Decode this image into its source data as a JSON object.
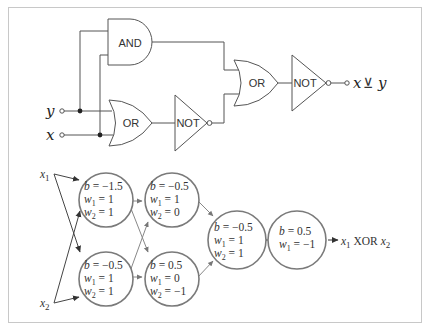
{
  "logic_circuit": {
    "inputs": [
      {
        "id": "y",
        "label": "y"
      },
      {
        "id": "x",
        "label": "x"
      }
    ],
    "gates": [
      {
        "id": "and1",
        "label": "AND"
      },
      {
        "id": "or1",
        "label": "OR"
      },
      {
        "id": "not1",
        "label": "NOT"
      },
      {
        "id": "or2",
        "label": "OR"
      },
      {
        "id": "not2",
        "label": "NOT"
      }
    ],
    "output": {
      "label_x": "x",
      "label_op": "⊻",
      "label_y": "y"
    }
  },
  "neural_network": {
    "inputs": [
      {
        "label": "x",
        "sub": "1"
      },
      {
        "label": "x",
        "sub": "2"
      }
    ],
    "neurons": [
      {
        "id": "n1",
        "lines": [
          [
            "b",
            "",
            " = −1.5"
          ],
          [
            "w",
            "1",
            " = 1"
          ],
          [
            "w",
            "2",
            " = 1"
          ]
        ]
      },
      {
        "id": "n2",
        "lines": [
          [
            "b",
            "",
            " = −0.5"
          ],
          [
            "w",
            "1",
            " = 1"
          ],
          [
            "w",
            "2",
            " = 1"
          ]
        ]
      },
      {
        "id": "n3",
        "lines": [
          [
            "b",
            "",
            " = −0.5"
          ],
          [
            "w",
            "1",
            " = 1"
          ],
          [
            "w",
            "2",
            " = 0"
          ]
        ]
      },
      {
        "id": "n4",
        "lines": [
          [
            "b",
            "",
            " = 0.5"
          ],
          [
            "w",
            "1",
            " = 0"
          ],
          [
            "w",
            "2",
            " = −1"
          ]
        ]
      },
      {
        "id": "n5",
        "lines": [
          [
            "b",
            "",
            " = −0.5"
          ],
          [
            "w",
            "1",
            " = 1"
          ],
          [
            "w",
            "2",
            " = 1"
          ]
        ]
      },
      {
        "id": "n6",
        "lines": [
          [
            "b",
            "",
            " = 0.5"
          ],
          [
            "w",
            "1",
            " = −1"
          ]
        ]
      }
    ],
    "output": {
      "x1": "x",
      "sub1": "1",
      "op": " XOR ",
      "x2": "x",
      "sub2": "2"
    }
  },
  "colors": {
    "line": "#555555",
    "circle": "#7a7a7a",
    "frame": "#c8c8c8"
  }
}
